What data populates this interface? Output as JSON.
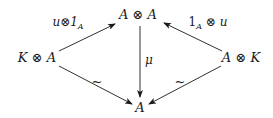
{
  "diagram": {
    "type": "commutative-diagram",
    "nodes": [
      {
        "id": "KA",
        "left": "K",
        "op": "⊗",
        "right": "A"
      },
      {
        "id": "AA",
        "left": "A",
        "op": "⊗",
        "right": "A"
      },
      {
        "id": "AK",
        "left": "A",
        "op": "⊗",
        "right": "K"
      },
      {
        "id": "A",
        "text": "A"
      }
    ],
    "edges": [
      {
        "from": "KA",
        "to": "AA",
        "label_main": "u⊗1",
        "label_sub": "A"
      },
      {
        "from": "AK",
        "to": "AA",
        "label_main": "1",
        "label_sub": "A",
        "label_rest": " ⊗ u"
      },
      {
        "from": "AA",
        "to": "A",
        "label": "μ"
      },
      {
        "from": "KA",
        "to": "A",
        "label": "~"
      },
      {
        "from": "AK",
        "to": "A",
        "label": "~"
      }
    ],
    "colors": {
      "ink": "#1a1a1a",
      "background": "#ffffff"
    }
  }
}
